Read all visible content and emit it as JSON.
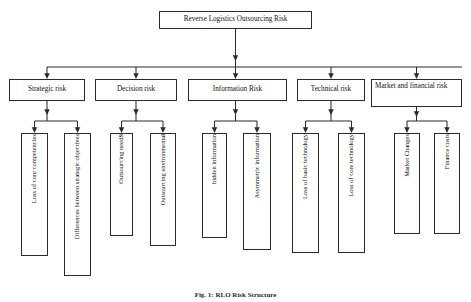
{
  "diagram": {
    "type": "hierarchical-tree",
    "title_node": {
      "label": "Reverse Logistics Outsourcing Risk",
      "x": 159,
      "y": 11,
      "w": 153,
      "h": 18
    },
    "level1": [
      {
        "id": "strategic-risk",
        "label": "Strategic risk",
        "x": 9,
        "y": 79,
        "w": 76,
        "h": 22,
        "align": "center"
      },
      {
        "id": "decision-risk",
        "label": "Decision risk",
        "x": 95,
        "y": 79,
        "w": 82,
        "h": 22,
        "align": "center"
      },
      {
        "id": "information-risk",
        "label": "Information Risk",
        "x": 188,
        "y": 79,
        "w": 99,
        "h": 22,
        "align": "center"
      },
      {
        "id": "technical-risk",
        "label": "Technical risk",
        "x": 297,
        "y": 79,
        "w": 68,
        "h": 22,
        "align": "center"
      },
      {
        "id": "market-financial-risk",
        "label": "Market and financial risk",
        "x": 371,
        "y": 79,
        "w": 91,
        "h": 28,
        "align": "left"
      }
    ],
    "level2": [
      {
        "id": "loss-of-core-competencies",
        "parent": "strategic-risk",
        "label": "Loss of core competencies",
        "bold_tail": "",
        "x": 21,
        "y": 133,
        "w": 27,
        "h": 123
      },
      {
        "id": "differences-strategic-objectives",
        "parent": "strategic-risk",
        "label": "Differences between strategic objectives",
        "bold_tail": "",
        "x": 64,
        "y": 133,
        "w": 27,
        "h": 143
      },
      {
        "id": "outsourcing-needs",
        "parent": "decision-risk",
        "label": "Outsourcing need",
        "bold_tail": "S",
        "x": 110,
        "y": 133,
        "w": 23,
        "h": 103
      },
      {
        "id": "outsourcing-environmental",
        "parent": "decision-risk",
        "label": "Outsourcing environmental",
        "bold_tail": "",
        "x": 150,
        "y": 133,
        "w": 26,
        "h": 113
      },
      {
        "id": "hidden-information",
        "parent": "information-risk",
        "label": "hidden information",
        "bold_tail": "",
        "x": 202,
        "y": 133,
        "w": 25,
        "h": 105
      },
      {
        "id": "asymmetric-information",
        "parent": "information-risk",
        "label": "Asymmetric information",
        "bold_tail": "",
        "x": 243,
        "y": 133,
        "w": 28,
        "h": 117
      },
      {
        "id": "loss-of-basic-technology",
        "parent": "technical-risk",
        "label": "Loss of basic technology",
        "bold_tail": "",
        "x": 292,
        "y": 133,
        "w": 27,
        "h": 120
      },
      {
        "id": "loss-of-core-technology",
        "parent": "technical-risk",
        "label": "Loss of core technology",
        "bold_tail": "",
        "x": 338,
        "y": 133,
        "w": 27,
        "h": 120
      },
      {
        "id": "market-changes",
        "parent": "market-financial-risk",
        "label": "Market Changes",
        "bold_tail": "",
        "x": 394,
        "y": 133,
        "w": 26,
        "h": 101
      },
      {
        "id": "finance-costs",
        "parent": "market-financial-risk",
        "label": "Finance costs",
        "bold_tail": "",
        "x": 434,
        "y": 133,
        "w": 26,
        "h": 101
      }
    ],
    "colors": {
      "stroke": "#2b2b2b",
      "fill": "#ffffff",
      "text": "#111111"
    }
  },
  "caption": {
    "text": "Fig. 1: RLO Risk Structure"
  }
}
